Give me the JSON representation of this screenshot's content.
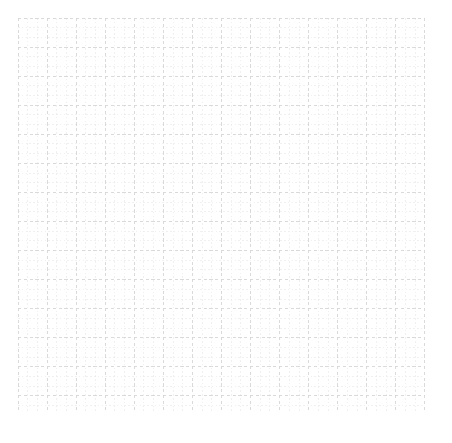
{
  "figure": {
    "width": 452,
    "height": 443,
    "background_color": "#ffffff"
  },
  "chart_data": {
    "type": "line",
    "title": "",
    "subtitle": "",
    "xlabel": "",
    "ylabel": "",
    "series": [],
    "categories": [],
    "x": [],
    "values": [],
    "annotations": [],
    "legend": {
      "visible": false,
      "position": "none",
      "entries": []
    },
    "axes": {
      "visible": false,
      "x_ticks": [],
      "y_ticks": [],
      "x_tick_labels": [],
      "y_tick_labels": [],
      "xlim": [
        0,
        42
      ],
      "ylim": [
        0,
        41
      ]
    },
    "grid": {
      "visible": true,
      "style": "graph-paper",
      "plot_area": {
        "left": 18,
        "top": 18,
        "width": 407,
        "height": 394
      },
      "minor": {
        "visible": true,
        "spacing_px": 9.69,
        "columns": 42,
        "rows": 41,
        "color": "#e9e9e9",
        "line_width": 0.7,
        "dash_pattern": "1.6 2.2"
      },
      "major": {
        "visible": true,
        "spacing_px": 29.07,
        "every_n_minor": 3,
        "columns": 14,
        "rows": 14,
        "color": "#d6d6d6",
        "line_width": 0.9,
        "dash_pattern": "3.2 2.6"
      },
      "border": {
        "visible": true,
        "color": "#d6d6d6",
        "line_width": 0.9,
        "dash_pattern": "3.2 2.6"
      }
    }
  }
}
